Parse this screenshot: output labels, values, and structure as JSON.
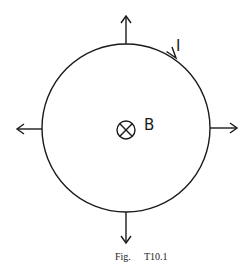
{
  "figure": {
    "current_label": "I",
    "field_label": "B",
    "field_symbol": "into-page-cross-icon",
    "caption_prefix": "Fig.",
    "caption_number": "T10.1",
    "colors": {
      "stroke": "#1a1a1a",
      "background": "#ffffff"
    },
    "circle": {
      "cx": 126,
      "cy": 128,
      "r": 84
    },
    "force_arrows": [
      "up",
      "down",
      "left",
      "right"
    ]
  }
}
